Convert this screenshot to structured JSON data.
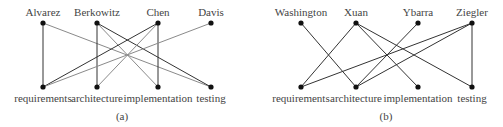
{
  "figure": {
    "subgraphs": [
      {
        "caption": "(a)",
        "top_nodes": [
          {
            "label": "Alvarez",
            "x": 43
          },
          {
            "label": "Berkowitz",
            "x": 97
          },
          {
            "label": "Chen",
            "x": 158
          },
          {
            "label": "Davis",
            "x": 211
          }
        ],
        "bottom_nodes": [
          {
            "label": "requirements",
            "x": 43
          },
          {
            "label": "architecture",
            "x": 97
          },
          {
            "label": "implementation",
            "x": 158
          },
          {
            "label": "testing",
            "x": 211
          }
        ],
        "edges": [
          {
            "from": 0,
            "to": 0,
            "style": "dark"
          },
          {
            "from": 0,
            "to": 3,
            "style": "light"
          },
          {
            "from": 1,
            "to": 1,
            "style": "dark"
          },
          {
            "from": 1,
            "to": 2,
            "style": "light"
          },
          {
            "from": 1,
            "to": 3,
            "style": "dark"
          },
          {
            "from": 2,
            "to": 0,
            "style": "dark"
          },
          {
            "from": 2,
            "to": 1,
            "style": "light"
          },
          {
            "from": 2,
            "to": 2,
            "style": "dark"
          },
          {
            "from": 3,
            "to": 0,
            "style": "light"
          }
        ],
        "caption_x": 122
      },
      {
        "caption": "(b)",
        "top_nodes": [
          {
            "label": "Washington",
            "x": 301
          },
          {
            "label": "Xuan",
            "x": 356
          },
          {
            "label": "Ybarra",
            "x": 418
          },
          {
            "label": "Ziegler",
            "x": 472
          }
        ],
        "bottom_nodes": [
          {
            "label": "requirements",
            "x": 301
          },
          {
            "label": "architecture",
            "x": 356
          },
          {
            "label": "implementation",
            "x": 418
          },
          {
            "label": "testing",
            "x": 472
          }
        ],
        "edges": [
          {
            "from": 0,
            "to": 1,
            "style": "dark"
          },
          {
            "from": 1,
            "to": 0,
            "style": "dark"
          },
          {
            "from": 1,
            "to": 2,
            "style": "dark"
          },
          {
            "from": 1,
            "to": 3,
            "style": "dark"
          },
          {
            "from": 2,
            "to": 1,
            "style": "dark"
          },
          {
            "from": 3,
            "to": 0,
            "style": "dark"
          },
          {
            "from": 3,
            "to": 1,
            "style": "dark"
          },
          {
            "from": 3,
            "to": 3,
            "style": "dark"
          }
        ],
        "caption_x": 386
      }
    ],
    "layout": {
      "top_y": 23,
      "bottom_y": 87,
      "top_label_y": 16,
      "bottom_label_y": 102,
      "caption_y": 120
    }
  }
}
